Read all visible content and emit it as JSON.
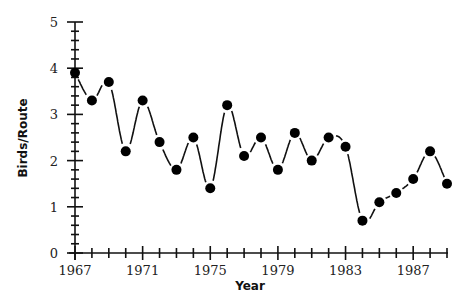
{
  "chart_data": {
    "type": "line",
    "title": "",
    "xlabel": "Year",
    "ylabel": "Birds/Route",
    "x": [
      1967,
      1968,
      1969,
      1970,
      1971,
      1972,
      1973,
      1974,
      1975,
      1976,
      1977,
      1978,
      1979,
      1980,
      1981,
      1982,
      1983,
      1984,
      1985,
      1986,
      1987,
      1988,
      1989
    ],
    "series": [
      {
        "name": "Birds/Route",
        "values": [
          3.9,
          3.3,
          3.7,
          2.2,
          3.3,
          2.4,
          1.8,
          2.5,
          1.4,
          3.2,
          2.1,
          2.5,
          1.8,
          2.6,
          2.0,
          2.5,
          2.3,
          0.7,
          1.1,
          1.3,
          1.6,
          2.2,
          1.5
        ]
      }
    ],
    "xlim": [
      1967,
      1989
    ],
    "ylim": [
      0,
      5
    ],
    "x_tick_labels": [
      "1967",
      "1971",
      "1975",
      "1979",
      "1983",
      "1987"
    ],
    "y_tick_labels": [
      "0",
      "1",
      "2",
      "3",
      "4",
      "5"
    ],
    "grid": false,
    "legend": null,
    "marker": "filled-circle",
    "line_style": "smoothed, broken around markers",
    "color": "#000000"
  }
}
